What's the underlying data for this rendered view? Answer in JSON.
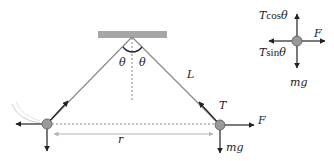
{
  "diagram": {
    "title": "",
    "colors": {
      "string": "#8a8a8a",
      "ball_fill": "#9a9a9a",
      "ball_stroke": "#555555",
      "ceiling": "#a6a6a6",
      "arrow": "#222222",
      "r_arrow": "#b5b5b5",
      "text": "#222222"
    },
    "labels": {
      "theta_left": "θ",
      "theta_right": "θ",
      "length": "L",
      "tension": "T",
      "force_right": "F",
      "weight": "mg",
      "separation": "r"
    },
    "free_body": {
      "up_label_T": "T",
      "up_label_fn": "cos",
      "up_label_theta": "θ",
      "left_label_T": "T",
      "left_label_fn": "sin",
      "left_label_theta": "θ",
      "right_label": "F",
      "down_label": "mg"
    },
    "nodes": [
      {
        "id": "pivot",
        "x": 132,
        "y": 37
      },
      {
        "id": "left-ball",
        "x": 47,
        "y": 124
      },
      {
        "id": "right-ball",
        "x": 220,
        "y": 125
      },
      {
        "id": "fbd-ball",
        "x": 297,
        "y": 41
      }
    ]
  }
}
